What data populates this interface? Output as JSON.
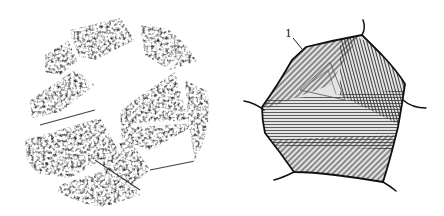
{
  "figure": {
    "panels": [
      {
        "id": "a",
        "kind": "micrograph",
        "shape": "circle",
        "center": [
          111,
          109
        ],
        "radius": 98,
        "colors": {
          "dark": "#151515",
          "light": "#ffffff"
        }
      },
      {
        "id": "b",
        "kind": "schematic-drawing",
        "subject": "polygonal grain with internal hatching",
        "labels": [
          {
            "text": "1",
            "x": 287,
            "y": 36,
            "leader_to": [
              302,
              49
            ]
          }
        ],
        "colors": {
          "outline": "#111111",
          "hatch": "#3a3a3a",
          "fill": "#d9d9d9"
        }
      }
    ]
  }
}
